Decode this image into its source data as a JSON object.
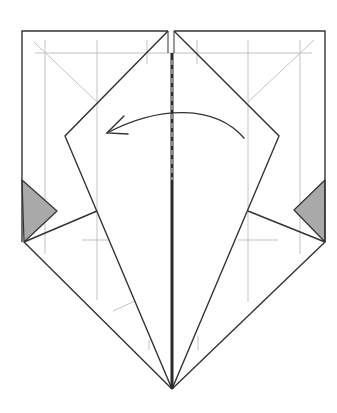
{
  "diagram": {
    "colors": {
      "background": "#ffffff",
      "outline": "#333333",
      "guide": "#bcbcbc",
      "shade": "#a9a9a9",
      "center_crease": "#2a2a2a"
    },
    "instruction_arrow": {
      "direction": "right-to-left",
      "meaning": "fold-over"
    },
    "shapes": {
      "outer_left_edge": [
        [
          22,
          31
        ],
        [
          22,
          242
        ]
      ],
      "outer_right_edge": [
        [
          325,
          31
        ],
        [
          325,
          242
        ]
      ],
      "top_left_edge": [
        [
          22,
          31
        ],
        [
          168,
          31
        ]
      ],
      "top_right_edge": [
        [
          174,
          31
        ],
        [
          325,
          31
        ]
      ],
      "kite_left": [
        [
          168,
          31
        ],
        [
          65,
          136
        ],
        [
          172,
          389
        ]
      ],
      "kite_right": [
        [
          174,
          31
        ],
        [
          279,
          136
        ],
        [
          172,
          389
        ]
      ],
      "inner_left_flap": [
        [
          24,
          242
        ],
        [
          97,
          211
        ]
      ],
      "inner_right_flap": [
        [
          325,
          242
        ],
        [
          248,
          211
        ]
      ],
      "bottom_left_edge": [
        [
          24,
          242
        ],
        [
          172,
          389
        ]
      ],
      "bottom_right_edge": [
        [
          325,
          242
        ],
        [
          172,
          389
        ]
      ],
      "shaded_left": [
        [
          22,
          180
        ],
        [
          57,
          211
        ],
        [
          24,
          242
        ]
      ],
      "shaded_right": [
        [
          325,
          180
        ],
        [
          294,
          210
        ],
        [
          325,
          242
        ]
      ]
    }
  }
}
